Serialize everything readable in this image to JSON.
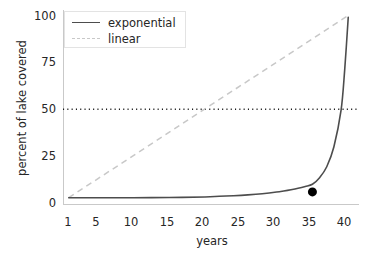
{
  "chart_data": {
    "type": "line",
    "title": "",
    "xlabel": "years",
    "ylabel": "percent of lake covered",
    "xlim": [
      0.2,
      41.5
    ],
    "ylim": [
      -4,
      103
    ],
    "xticks": [
      1,
      5,
      10,
      15,
      20,
      25,
      30,
      35,
      40
    ],
    "yticks": [
      0,
      25,
      50,
      75,
      100
    ],
    "grid": false,
    "legend_position": "upper left",
    "series": [
      {
        "name": "exponential",
        "style": "solid",
        "color": "#4d4d4d",
        "x": [
          1,
          5,
          10,
          15,
          20,
          22,
          24,
          26,
          28,
          30,
          31,
          32,
          33,
          34,
          35,
          36,
          37,
          38,
          39,
          39.5,
          40
        ],
        "y": [
          0.0001,
          0.0015,
          0.012,
          0.1,
          0.39,
          0.78,
          1.1,
          1.56,
          2.2,
          3.1,
          3.7,
          4.4,
          5.2,
          6.2,
          7.4,
          11.0,
          17.0,
          28.0,
          48.0,
          70.0,
          99.0
        ]
      },
      {
        "name": "linear",
        "style": "dashed",
        "color": "#c8c8c8",
        "x": [
          1,
          40
        ],
        "y": [
          0,
          100
        ]
      }
    ],
    "annotations": [
      {
        "type": "hline",
        "name": "half-covered-threshold",
        "y": 48.5,
        "style": "dotted",
        "color": "#1a1a1a"
      },
      {
        "type": "point",
        "name": "highlight-marker",
        "x": 35,
        "y": 3.2,
        "color": "#000000",
        "size": 9
      }
    ]
  },
  "axis": {
    "ylabel": "percent of lake covered",
    "xlabel": "years",
    "yticklabels": [
      "100",
      "75",
      "50",
      "25",
      "0"
    ],
    "xticklabels": [
      "1",
      "5",
      "10",
      "15",
      "20",
      "25",
      "30",
      "35",
      "40"
    ]
  },
  "legend": {
    "entries": [
      {
        "label": "exponential",
        "style": "solid"
      },
      {
        "label": "linear",
        "style": "dashed"
      }
    ]
  },
  "colors": {
    "exponential": "#4d4d4d",
    "linear": "#c8c8c8",
    "threshold": "#1a1a1a",
    "marker": "#000000",
    "spine": "#c9c9c9",
    "text": "#262626"
  }
}
